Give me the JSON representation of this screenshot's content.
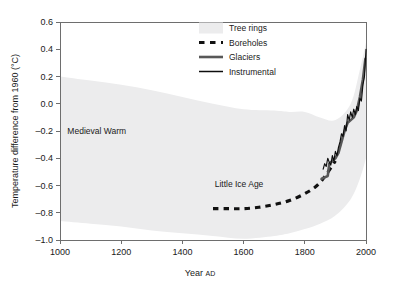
{
  "chart_data": {
    "type": "line",
    "title": "",
    "xlabel": "Year",
    "xlabel_suffix": "AD",
    "ylabel": "Temperature difference from 1960 (°C)",
    "xlim": [
      1000,
      2000
    ],
    "ylim": [
      -1.0,
      0.6
    ],
    "grid": false,
    "legend_position": "top-center",
    "xticks": [
      1000,
      1200,
      1400,
      1600,
      1800,
      2000
    ],
    "xtick_labels": [
      "1000",
      "1200",
      "1400",
      "1600",
      "1800",
      "2000"
    ],
    "yticks": [
      -1.0,
      -0.8,
      -0.6,
      -0.4,
      -0.2,
      0.0,
      0.2,
      0.4,
      0.6
    ],
    "ytick_labels": [
      "–1.0",
      "–0.8",
      "–0.6",
      "–0.4",
      "–0.2",
      "0.0",
      "0.2",
      "0.4",
      "0.6"
    ],
    "series": [
      {
        "name": "Tree rings",
        "type": "band",
        "color": "#ececed",
        "x": [
          1000,
          1100,
          1200,
          1300,
          1400,
          1500,
          1600,
          1700,
          1750,
          1800,
          1850,
          1900,
          1950,
          1980,
          2000
        ],
        "upper": [
          0.2,
          0.17,
          0.14,
          0.1,
          0.05,
          0.0,
          -0.04,
          -0.05,
          -0.06,
          -0.06,
          -0.1,
          -0.12,
          0.0,
          0.25,
          0.45
        ],
        "lower": [
          -0.86,
          -0.88,
          -0.9,
          -0.93,
          -0.95,
          -0.97,
          -0.99,
          -0.97,
          -0.95,
          -0.92,
          -0.88,
          -0.82,
          -0.7,
          -0.55,
          -0.4
        ]
      },
      {
        "name": "Boreholes",
        "type": "dashed-line",
        "color": "#111111",
        "x": [
          1500,
          1550,
          1600,
          1650,
          1700,
          1750,
          1800,
          1840,
          1870,
          1900
        ],
        "y": [
          -0.77,
          -0.77,
          -0.77,
          -0.76,
          -0.74,
          -0.71,
          -0.66,
          -0.6,
          -0.52,
          -0.42
        ]
      },
      {
        "name": "Glaciers",
        "type": "line",
        "color": "#585858",
        "x": [
          1855,
          1865,
          1875,
          1880,
          1885,
          1890,
          1895,
          1900,
          1910,
          1920,
          1930,
          1940,
          1950,
          1960,
          1970,
          1980,
          1990,
          1998
        ],
        "y": [
          -0.55,
          -0.54,
          -0.53,
          -0.44,
          -0.43,
          -0.42,
          -0.41,
          -0.4,
          -0.36,
          -0.28,
          -0.2,
          -0.14,
          -0.12,
          -0.1,
          -0.05,
          0.05,
          0.18,
          0.33
        ]
      },
      {
        "name": "Instrumental",
        "type": "line",
        "color": "#0d0d0d",
        "x": [
          1860,
          1865,
          1870,
          1875,
          1880,
          1885,
          1890,
          1895,
          1900,
          1905,
          1910,
          1915,
          1920,
          1925,
          1930,
          1935,
          1940,
          1945,
          1950,
          1955,
          1960,
          1965,
          1970,
          1975,
          1980,
          1985,
          1990,
          1995,
          2000
        ],
        "y": [
          -0.48,
          -0.44,
          -0.46,
          -0.4,
          -0.43,
          -0.45,
          -0.38,
          -0.42,
          -0.35,
          -0.38,
          -0.32,
          -0.28,
          -0.22,
          -0.24,
          -0.16,
          -0.2,
          -0.08,
          -0.12,
          -0.06,
          -0.1,
          -0.04,
          -0.08,
          -0.02,
          -0.05,
          0.04,
          0.02,
          0.14,
          0.2,
          0.4
        ]
      }
    ],
    "annotations": [
      {
        "text": "Medieval Warm",
        "x": 1120,
        "y": -0.22
      },
      {
        "text": "Little Ice Age",
        "x": 1585,
        "y": -0.61
      }
    ],
    "legend": [
      {
        "label": "Tree rings",
        "marker": "band",
        "color": "#ececed"
      },
      {
        "label": "Boreholes",
        "marker": "dashed",
        "color": "#111111"
      },
      {
        "label": "Glaciers",
        "marker": "line-thick",
        "color": "#585858"
      },
      {
        "label": "Instrumental",
        "marker": "line-thin",
        "color": "#0d0d0d"
      }
    ]
  }
}
